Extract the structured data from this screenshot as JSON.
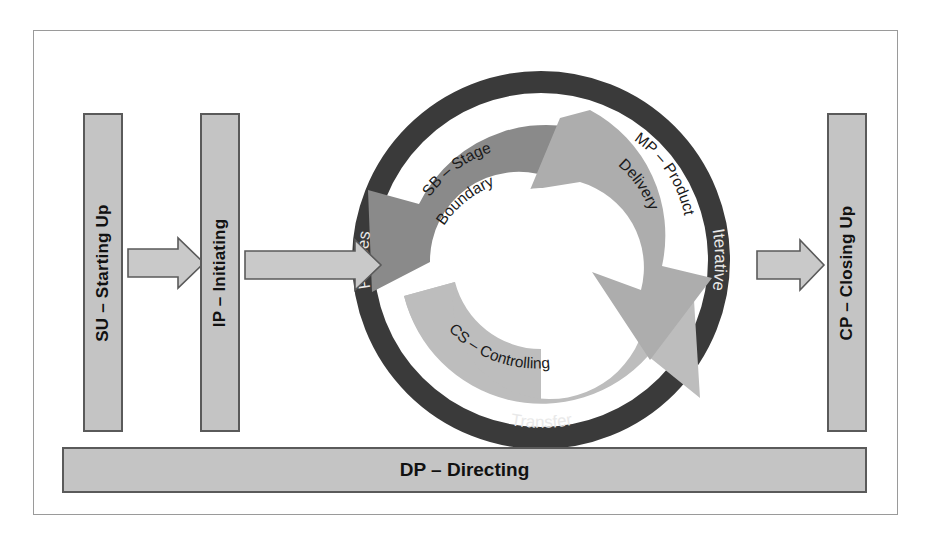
{
  "diagram": {
    "title_absent": true,
    "frame": {
      "border_color": "#9a9a9a",
      "background": "#ffffff"
    },
    "colors": {
      "box_fill": "#c4c4c4",
      "box_border": "#5a5a5a",
      "ring_dark": "#3a3a3a",
      "ring_text": "#e9e9e9",
      "arrow_sb": "#8a8a8a",
      "arrow_mp": "#adadad",
      "arrow_cs": "#bdbdbd",
      "hub_white": "#ffffff",
      "connector_fill": "#c9c9c9",
      "connector_border": "#5a5a5a",
      "label_dark": "#111111"
    },
    "boxes": [
      {
        "id": "su",
        "label": "SU – Starting Up",
        "orientation": "vertical"
      },
      {
        "id": "ip",
        "label": "IP – Initiating",
        "orientation": "vertical"
      },
      {
        "id": "cp",
        "label": "CP – Closing Up",
        "orientation": "vertical"
      }
    ],
    "bottom_bar": {
      "id": "dp",
      "label": "DP – Directing",
      "orientation": "horizontal"
    },
    "ring_labels": [
      {
        "id": "phases",
        "text": "Phases",
        "position": "left"
      },
      {
        "id": "iterative",
        "text": "Iterative",
        "position": "right"
      },
      {
        "id": "transfer",
        "text": "Transfer",
        "position": "bottom"
      }
    ],
    "cycle_arrows": [
      {
        "id": "sb",
        "line1": "SB – Stage",
        "line2": "Boundary",
        "text": "SB – Stage Boundary",
        "position": "upper-left",
        "shade": "#8a8a8a"
      },
      {
        "id": "mp",
        "line1": "MP – Product",
        "line2": "Delivery",
        "text": "MP – Product Delivery",
        "position": "upper-right",
        "shade": "#adadad"
      },
      {
        "id": "cs",
        "line1": "CS – Controlling",
        "line2": "",
        "text": "CS – Controlling",
        "position": "bottom",
        "shade": "#bdbdbd"
      }
    ],
    "connectors": [
      {
        "id": "su-to-ip",
        "from": "su",
        "to": "ip",
        "style": "block-arrow-right"
      },
      {
        "id": "ip-to-cycle",
        "from": "ip",
        "to": "cycle",
        "style": "block-arrow-right"
      },
      {
        "id": "cycle-to-cp",
        "from": "cycle",
        "to": "cp",
        "style": "block-arrow-right"
      }
    ]
  }
}
